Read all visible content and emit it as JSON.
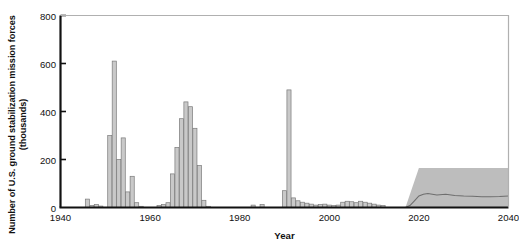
{
  "chart_data": {
    "type": "bar",
    "title": "",
    "xlabel": "Year",
    "ylabel": "Number of U.S. ground stabilization mission forces (thousands)",
    "xlim": [
      1940,
      2040
    ],
    "ylim": [
      0,
      800
    ],
    "xticks": [
      1940,
      1960,
      1980,
      2000,
      2020,
      2040
    ],
    "yticks": [
      0,
      200,
      400,
      600,
      800
    ],
    "grid": false,
    "legend": "none",
    "bar_color": "#c9c9c9",
    "bar_edge_color": "#7a7a7a",
    "band_color": "#bdbdbd",
    "median_line_color": "#6e6e6e",
    "axis_color": "#111111",
    "frame_color": "#b0b0b0",
    "x": [
      1941,
      1942,
      1943,
      1944,
      1945,
      1946,
      1947,
      1948,
      1949,
      1950,
      1951,
      1952,
      1953,
      1954,
      1955,
      1956,
      1957,
      1958,
      1959,
      1960,
      1961,
      1962,
      1963,
      1964,
      1965,
      1966,
      1967,
      1968,
      1969,
      1970,
      1971,
      1972,
      1973,
      1974,
      1975,
      1976,
      1977,
      1978,
      1979,
      1980,
      1981,
      1982,
      1983,
      1984,
      1985,
      1986,
      1987,
      1988,
      1989,
      1990,
      1991,
      1992,
      1993,
      1994,
      1995,
      1996,
      1997,
      1998,
      1999,
      2000,
      2001,
      2002,
      2003,
      2004,
      2005,
      2006,
      2007,
      2008,
      2009,
      2010,
      2011,
      2012
    ],
    "values": [
      0,
      0,
      0,
      0,
      0,
      35,
      8,
      12,
      6,
      0,
      300,
      610,
      200,
      290,
      65,
      130,
      20,
      5,
      0,
      0,
      0,
      8,
      12,
      20,
      140,
      250,
      370,
      440,
      420,
      330,
      175,
      30,
      5,
      0,
      0,
      0,
      0,
      0,
      0,
      0,
      0,
      0,
      10,
      0,
      12,
      0,
      0,
      0,
      0,
      70,
      490,
      40,
      28,
      22,
      18,
      14,
      10,
      12,
      14,
      10,
      8,
      10,
      22,
      26,
      24,
      20,
      26,
      22,
      18,
      14,
      10,
      8
    ],
    "projection_band": {
      "label": "projected range",
      "x_start": 2017,
      "x_end": 2040,
      "lower": 0,
      "upper": 165,
      "ramp_end_year": 2020
    },
    "projection_median": {
      "label": "projected median",
      "x": [
        2017,
        2018,
        2019,
        2020,
        2021,
        2022,
        2024,
        2026,
        2028,
        2030,
        2032,
        2034,
        2036,
        2038,
        2040
      ],
      "y": [
        0,
        8,
        28,
        48,
        55,
        58,
        52,
        55,
        50,
        48,
        47,
        45,
        45,
        46,
        48
      ]
    }
  }
}
